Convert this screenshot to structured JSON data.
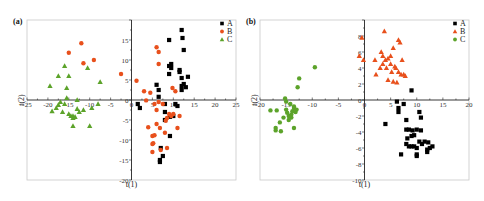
{
  "chart_data": [
    {
      "panel": "(a)",
      "type": "scatter",
      "xlabel": "t(1)",
      "ylabel": "t(2)",
      "xlim": [
        -25,
        25
      ],
      "ylim": [
        -20,
        20
      ],
      "xticks": [
        -25,
        -20,
        -15,
        -10,
        -5,
        0,
        5,
        10,
        15,
        20,
        25
      ],
      "yticks": [
        -20,
        -15,
        -10,
        -5,
        0,
        5,
        10,
        15
      ],
      "legend_position": "top-right",
      "grid": false,
      "series": [
        {
          "name": "A",
          "marker": "square",
          "color": "#000000",
          "points": [
            [
              1.5,
              -1
            ],
            [
              2,
              -2
            ],
            [
              6,
              3.8
            ],
            [
              6.5,
              2.5
            ],
            [
              6.5,
              0.8
            ],
            [
              7,
              -12
            ],
            [
              6.8,
              -15
            ],
            [
              6.8,
              -15.5
            ],
            [
              7.5,
              -14
            ],
            [
              8,
              -1
            ],
            [
              8,
              -3
            ],
            [
              8,
              -5
            ],
            [
              9,
              15
            ],
            [
              9,
              8.5
            ],
            [
              9.5,
              9
            ],
            [
              9.5,
              8
            ],
            [
              9,
              6.5
            ],
            [
              9.2,
              -4.2
            ],
            [
              9.2,
              -9
            ],
            [
              10,
              -4
            ],
            [
              10.5,
              -1
            ],
            [
              11,
              -1.5
            ],
            [
              11.5,
              7.5
            ],
            [
              11.5,
              7
            ],
            [
              12,
              5.5
            ],
            [
              12,
              17.5
            ],
            [
              12.2,
              15.5
            ],
            [
              12.5,
              12.5
            ],
            [
              12,
              3.5
            ],
            [
              12,
              2.5
            ],
            [
              12.5,
              4
            ],
            [
              13,
              3.2
            ],
            [
              13.5,
              5.8
            ]
          ]
        },
        {
          "name": "B",
          "marker": "circle",
          "color": "#e8501c",
          "points": [
            [
              -15,
              11.8
            ],
            [
              -12,
              14.2
            ],
            [
              -11.5,
              9.2
            ],
            [
              -9,
              10
            ],
            [
              -2.5,
              6.5
            ],
            [
              1.2,
              4.8
            ],
            [
              3,
              2.2
            ],
            [
              3.5,
              -0.1
            ],
            [
              4,
              -6.8
            ],
            [
              4.5,
              1.8
            ],
            [
              5,
              -9
            ],
            [
              5,
              -11
            ],
            [
              5,
              -13
            ],
            [
              5.2,
              -10.8
            ],
            [
              5.5,
              -8.8
            ],
            [
              5.5,
              -1
            ],
            [
              6,
              -2.5
            ],
            [
              6,
              -6
            ],
            [
              6,
              13.2
            ],
            [
              6.5,
              12
            ],
            [
              6.5,
              9
            ],
            [
              6.5,
              -0.5
            ],
            [
              6.8,
              -7
            ],
            [
              7,
              -12.5
            ],
            [
              7.5,
              -1
            ],
            [
              8,
              -8.2
            ],
            [
              8.2,
              -5.2
            ],
            [
              8.5,
              -12
            ],
            [
              8.5,
              -4.5
            ],
            [
              9,
              -3.5
            ],
            [
              9.5,
              -4
            ],
            [
              9.8,
              3
            ],
            [
              10,
              -3.5
            ],
            [
              10.5,
              2.2
            ],
            [
              11,
              -7
            ],
            [
              11.5,
              -4
            ]
          ]
        },
        {
          "name": "C",
          "marker": "triangle",
          "color": "#5ca32a",
          "points": [
            [
              -19.5,
              3.5
            ],
            [
              -19,
              -2.8
            ],
            [
              -18,
              -2
            ],
            [
              -17.5,
              -1.2
            ],
            [
              -17,
              -0.5
            ],
            [
              -17.5,
              6
            ],
            [
              -16.5,
              -3
            ],
            [
              -16,
              8.5
            ],
            [
              -16,
              -1
            ],
            [
              -15.5,
              3
            ],
            [
              -15.5,
              0.5
            ],
            [
              -15,
              6
            ],
            [
              -15,
              -3.5
            ],
            [
              -14.5,
              -4
            ],
            [
              -14,
              -4
            ],
            [
              -14,
              -4.5
            ],
            [
              -14,
              -6.5
            ],
            [
              -13.5,
              -4.2
            ],
            [
              -13,
              -2.2
            ],
            [
              -13,
              0
            ],
            [
              -12.5,
              -3
            ],
            [
              -11.5,
              -2.5
            ],
            [
              -10.5,
              8
            ],
            [
              -10,
              -6.5
            ],
            [
              -9.5,
              -2
            ],
            [
              -8,
              -1
            ],
            [
              -7.5,
              4.5
            ]
          ]
        }
      ]
    },
    {
      "panel": "(b)",
      "type": "scatter",
      "xlabel": "t(1)",
      "ylabel": "t(2)",
      "xlim": [
        -20,
        20
      ],
      "ylim": [
        -10,
        10
      ],
      "xticks": [
        -20,
        -15,
        -10,
        -5,
        0,
        5,
        10,
        15,
        20
      ],
      "yticks": [
        -10,
        -8,
        -6,
        -4,
        -2,
        0,
        2,
        4,
        6,
        8
      ],
      "legend_position": "top-right",
      "grid": false,
      "series": [
        {
          "name": "A",
          "marker": "square",
          "color": "#000000",
          "points": [
            [
              4,
              -3
            ],
            [
              6.2,
              -0.2
            ],
            [
              6.5,
              -1
            ],
            [
              6.5,
              -1.5
            ],
            [
              7,
              -6.8
            ],
            [
              7.5,
              -0.5
            ],
            [
              8,
              -3.7
            ],
            [
              8,
              -5.5
            ],
            [
              8,
              -2.5
            ],
            [
              8.2,
              -4.8
            ],
            [
              8.5,
              -3.7
            ],
            [
              8.5,
              -5.8
            ],
            [
              9,
              1.2
            ],
            [
              9,
              -4.5
            ],
            [
              9,
              -5.8
            ],
            [
              9.2,
              -3.8
            ],
            [
              9.5,
              -4.4
            ],
            [
              9.5,
              -5.8
            ],
            [
              10,
              -3.7
            ],
            [
              10,
              -6
            ],
            [
              10,
              -6.8
            ],
            [
              10,
              -7
            ],
            [
              10.5,
              -1.5
            ],
            [
              10.5,
              -5.2
            ],
            [
              10.8,
              -2.2
            ],
            [
              10.8,
              -3.8
            ],
            [
              11,
              -5.5
            ],
            [
              11.5,
              -5.2
            ],
            [
              12,
              -6.2
            ],
            [
              12,
              -6.5
            ],
            [
              12.2,
              -5.3
            ],
            [
              12.5,
              -6
            ],
            [
              13,
              -5.8
            ]
          ]
        },
        {
          "name": "B",
          "marker": "triangle",
          "color": "#e8501c",
          "points": [
            [
              -1,
              5.5
            ],
            [
              -0.5,
              7.8
            ],
            [
              -0.2,
              5
            ],
            [
              2,
              5
            ],
            [
              2.2,
              3.2
            ],
            [
              3,
              4
            ],
            [
              3.2,
              6
            ],
            [
              3.5,
              5.5
            ],
            [
              3.5,
              4.5
            ],
            [
              3.8,
              8.6
            ],
            [
              4,
              5
            ],
            [
              4.2,
              4
            ],
            [
              4.5,
              2.5
            ],
            [
              4.5,
              5.2
            ],
            [
              5,
              5.5
            ],
            [
              5,
              4.5
            ],
            [
              5.2,
              3.5
            ],
            [
              5.5,
              6.5
            ],
            [
              5.5,
              2.3
            ],
            [
              5.8,
              4.2
            ],
            [
              6,
              4
            ],
            [
              6.2,
              2.2
            ],
            [
              6.5,
              7.5
            ],
            [
              6.5,
              3.5
            ],
            [
              6.8,
              7.2
            ],
            [
              7,
              3.2
            ],
            [
              7.2,
              5
            ],
            [
              7.5,
              3.2
            ],
            [
              7.8,
              3
            ]
          ]
        },
        {
          "name": "C",
          "marker": "circle",
          "color": "#5ca32a",
          "points": [
            [
              -18,
              -1.3
            ],
            [
              -17,
              -3.5
            ],
            [
              -17,
              -3.8
            ],
            [
              -16.8,
              -1.3
            ],
            [
              -16.2,
              -2.8
            ],
            [
              -16,
              -3.9
            ],
            [
              -15.5,
              -2.2
            ],
            [
              -15.2,
              0.2
            ],
            [
              -15,
              -0.2
            ],
            [
              -15,
              -1.2
            ],
            [
              -14.8,
              -1.6
            ],
            [
              -14.5,
              -2
            ],
            [
              -14.5,
              -2.5
            ],
            [
              -14.2,
              -0.5
            ],
            [
              -14,
              -1.8
            ],
            [
              -14,
              -2.2
            ],
            [
              -13.8,
              -1.4
            ],
            [
              -13.5,
              -3.5
            ],
            [
              -13.5,
              -1
            ],
            [
              -13.5,
              -0.8
            ],
            [
              -13.2,
              -1.5
            ],
            [
              -13,
              -1.2
            ],
            [
              -12.8,
              1.6
            ],
            [
              -12.5,
              2.7
            ],
            [
              -9.5,
              4.1
            ]
          ]
        }
      ]
    }
  ],
  "panels": {
    "a": {
      "label": "(a)",
      "xlabel": "t(1)",
      "ylabel": "t(2)",
      "legend": [
        "A",
        "B",
        "C"
      ]
    },
    "b": {
      "label": "(b)",
      "xlabel": "t(1)",
      "ylabel": "t(2)",
      "legend": [
        "A",
        "B",
        "C"
      ]
    }
  }
}
